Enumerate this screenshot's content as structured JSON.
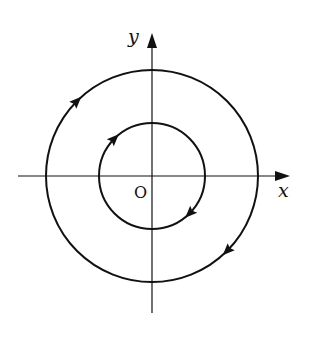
{
  "diagram": {
    "type": "phase-portrait",
    "axes": {
      "x_label": "x",
      "y_label": "y",
      "origin_label": "O"
    },
    "orbits": [
      {
        "name": "inner-orbit",
        "relative_radius": 0.5,
        "direction": "clockwise",
        "arrow_count": 2
      },
      {
        "name": "outer-orbit",
        "relative_radius": 1.0,
        "direction": "clockwise",
        "arrow_count": 2
      }
    ],
    "colors": {
      "ink": "#111111",
      "background": "#ffffff"
    }
  }
}
